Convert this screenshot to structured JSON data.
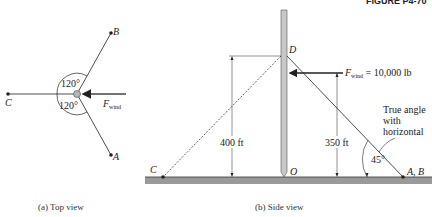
{
  "figure_label": "FIGURE P4-70",
  "top_view": {
    "caption": "(a)  Top view",
    "points": {
      "B": "B",
      "C": "C",
      "A": "A"
    },
    "angle_upper": "120°",
    "angle_lower": "120°",
    "force_label": "F",
    "force_sub": "wind"
  },
  "side_view": {
    "caption": "(b)  Side view",
    "points": {
      "D": "D",
      "C": "C",
      "O": "O",
      "AB": "A, B"
    },
    "dim_400": "400 ft",
    "dim_350": "350 ft",
    "force_label": "F",
    "force_sub": "wind",
    "force_value": " = 10,000 lb",
    "note_line1": "True angle",
    "note_line2": "with",
    "note_line3": "horizontal",
    "angle": "45°"
  },
  "colors": {
    "ground": "#9a9a9a",
    "pole": "#c8c8c8",
    "line": "#222222"
  }
}
